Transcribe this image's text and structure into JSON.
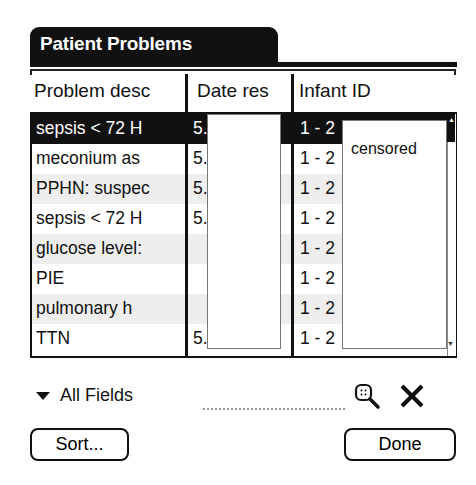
{
  "window": {
    "title": "Patient Problems"
  },
  "table": {
    "columns": [
      {
        "label": "Problem desc"
      },
      {
        "label": "Date res"
      },
      {
        "label": "Infant ID"
      }
    ],
    "rows": [
      {
        "problem": "sepsis < 72 H",
        "date": "5.",
        "infant_id": "1 - 2",
        "selected": true
      },
      {
        "problem": "meconium as",
        "date": "5.",
        "infant_id": "1 - 2"
      },
      {
        "problem": "PPHN: suspec",
        "date": "5.",
        "infant_id": "1 - 2"
      },
      {
        "problem": "sepsis < 72 H",
        "date": "5.",
        "infant_id": "1 - 2"
      },
      {
        "problem": "glucose level:",
        "date": "",
        "infant_id": "1 - 2"
      },
      {
        "problem": "PIE",
        "date": "",
        "infant_id": "1 - 2"
      },
      {
        "problem": "pulmonary h",
        "date": "",
        "infant_id": "1 - 2"
      },
      {
        "problem": "TTN",
        "date": "5.",
        "infant_id": "1 - 2"
      }
    ],
    "censor_label": "censored"
  },
  "filter": {
    "field_selector": "All Fields",
    "search_value": "",
    "find_icon": "magnifier-icon",
    "clear_icon": "x-icon"
  },
  "buttons": {
    "sort": "Sort...",
    "done": "Done"
  },
  "scrollbar": {
    "up_arrow": "▲",
    "down_arrow": "▼"
  }
}
